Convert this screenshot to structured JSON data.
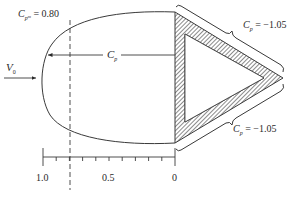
{
  "figure": {
    "type": "pressure-coefficient diagram",
    "freestream": {
      "symbol": "V",
      "subscript": "0"
    },
    "stagnation_label": {
      "symbol": "C",
      "subscript": "p",
      "subsubscript": "m",
      "equals": "=",
      "value": "0.80"
    },
    "body_arrow_label": {
      "symbol": "C",
      "subscript": "p"
    },
    "upper_brace_label": {
      "symbol": "C",
      "subscript": "p",
      "equals": "=",
      "value": "−1.05"
    },
    "lower_brace_label": {
      "symbol": "C",
      "subscript": "p",
      "equals": "=",
      "value": "−1.05"
    },
    "scale_axis": {
      "tick_labels": [
        "1.0",
        "0.5",
        "0"
      ],
      "range": [
        1.0,
        0
      ],
      "minor_ticks": 10
    },
    "colors": {
      "line": "#3a3a3a",
      "background": "#ffffff"
    }
  }
}
